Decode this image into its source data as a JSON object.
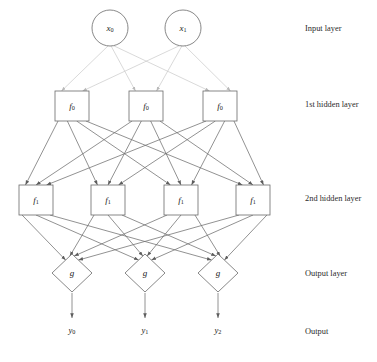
{
  "diagram": {
    "background_color": "#ffffff",
    "edge_color_input": "#c8c8c8",
    "edge_color_hidden": "#6e6e6e",
    "edge_color_output": "#6e6e6e",
    "node_stroke_color": "#6a6a6a",
    "node_fill_color": "#ffffff",
    "text_color": "#1a1a1a"
  },
  "captions": [
    {
      "id": "input-layer",
      "text": "Input layer",
      "x": 305,
      "y": 29
    },
    {
      "id": "hidden-layer-1",
      "text": "1st hidden layer",
      "x": 305,
      "y": 105
    },
    {
      "id": "hidden-layer-2",
      "text": "2nd hidden layer",
      "x": 305,
      "y": 199
    },
    {
      "id": "output-layer",
      "text": "Output layer",
      "x": 305,
      "y": 274
    },
    {
      "id": "output",
      "text": "Output",
      "x": 305,
      "y": 332
    }
  ],
  "layers": {
    "input": {
      "name": "input-layer",
      "shape": "circle",
      "radius": 18,
      "cy": 28,
      "nodes": [
        {
          "id": "x0",
          "label": "x",
          "sub": "0",
          "cx": 110
        },
        {
          "id": "x1",
          "label": "x",
          "sub": "1",
          "cx": 183
        }
      ]
    },
    "hidden1": {
      "name": "hidden-layer-1",
      "shape": "rect",
      "width": 34,
      "height": 30,
      "cy": 106,
      "nodes": [
        {
          "id": "h1-0",
          "label": "f",
          "sub": "0",
          "cx": 72
        },
        {
          "id": "h1-1",
          "label": "f",
          "sub": "0",
          "cx": 146
        },
        {
          "id": "h1-2",
          "label": "f",
          "sub": "0",
          "cx": 220
        }
      ]
    },
    "hidden2": {
      "name": "hidden-layer-2",
      "shape": "rect",
      "width": 34,
      "height": 30,
      "cy": 200,
      "nodes": [
        {
          "id": "h2-0",
          "label": "f",
          "sub": "1",
          "cx": 36
        },
        {
          "id": "h2-1",
          "label": "f",
          "sub": "1",
          "cx": 108
        },
        {
          "id": "h2-2",
          "label": "f",
          "sub": "1",
          "cx": 181
        },
        {
          "id": "h2-3",
          "label": "f",
          "sub": "1",
          "cx": 253
        }
      ]
    },
    "output": {
      "name": "output-layer",
      "shape": "diamond",
      "half_width": 20,
      "half_height": 19,
      "cy": 273,
      "nodes": [
        {
          "id": "g0",
          "label": "g",
          "sub": "",
          "cx": 72
        },
        {
          "id": "g1",
          "label": "g",
          "sub": "",
          "cx": 145
        },
        {
          "id": "g2",
          "label": "g",
          "sub": "",
          "cx": 218
        }
      ]
    },
    "outputs": {
      "name": "output-values",
      "cy": 331,
      "arrow_from_y": 293,
      "arrow_to_y": 318,
      "nodes": [
        {
          "id": "y0",
          "label": "y",
          "sub": "0",
          "cx": 72
        },
        {
          "id": "y1",
          "label": "y",
          "sub": "1",
          "cx": 145
        },
        {
          "id": "y2",
          "label": "y",
          "sub": "2",
          "cx": 218
        }
      ]
    }
  },
  "connections": {
    "input_to_hidden1": {
      "from": "input",
      "to": "hidden1",
      "style": "light",
      "count": 6
    },
    "hidden1_to_hidden2": {
      "from": "hidden1",
      "to": "hidden2",
      "style": "dark",
      "count": 12
    },
    "hidden2_to_output": {
      "from": "hidden2",
      "to": "output",
      "style": "dark",
      "count": 12
    }
  }
}
